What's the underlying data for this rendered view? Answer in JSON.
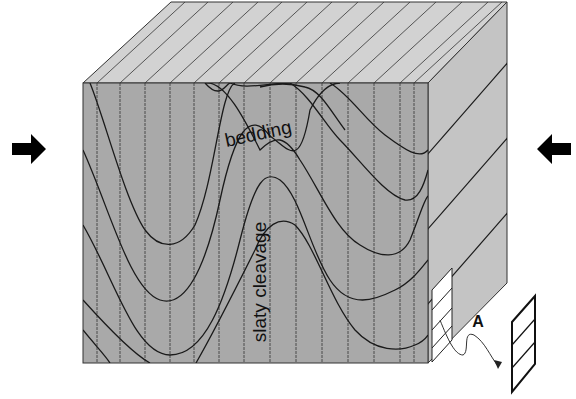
{
  "figure": {
    "labels": {
      "bedding": "bedding",
      "cleavage": "slaty cleavage",
      "sample": "A"
    },
    "arrows": {
      "left": "compression-arrow-right",
      "right": "compression-arrow-left"
    },
    "colors": {
      "front_face": "#a9a9a9",
      "top_face": "#d2d2d2",
      "side_face": "#c4c4c4",
      "line": "#1a1a1a",
      "background": "#ffffff"
    }
  }
}
